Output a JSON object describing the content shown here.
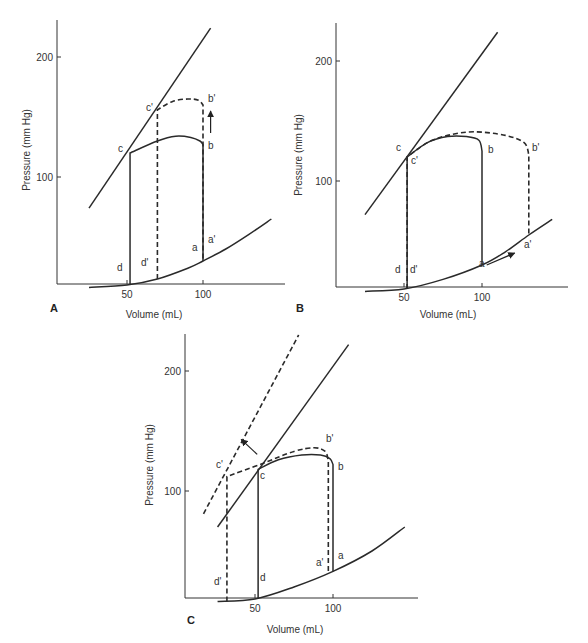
{
  "figure": {
    "panels": [
      {
        "id": "A",
        "label": "A",
        "frame": {
          "x_axis_px": 57,
          "y_axis_bottom_px": 284,
          "y_axis_top_px": 20,
          "x_axis_right_px": 285,
          "x50_px": 127,
          "x100_px": 203,
          "y100_px": 177,
          "y200_px": 57
        },
        "label_pos": {
          "x": 50,
          "y": 312
        },
        "xlabel_pos": {
          "x": 154,
          "y": 318
        },
        "ylabel_pos": {
          "x": 30,
          "y": 150
        }
      },
      {
        "id": "B",
        "label": "B",
        "frame": {
          "x_axis_px": 336,
          "y_axis_bottom_px": 287,
          "y_axis_top_px": 23,
          "x_axis_right_px": 568,
          "x50_px": 404,
          "x100_px": 482,
          "y100_px": 181,
          "y200_px": 61
        },
        "label_pos": {
          "x": 296,
          "y": 312
        },
        "xlabel_pos": {
          "x": 448,
          "y": 318
        },
        "ylabel_pos": {
          "x": 302,
          "y": 155
        }
      },
      {
        "id": "C",
        "label": "C",
        "frame": {
          "x_axis_px": 185,
          "y_axis_bottom_px": 598,
          "y_axis_top_px": 334,
          "x_axis_right_px": 418,
          "x50_px": 255,
          "x100_px": 333,
          "y100_px": 491,
          "y200_px": 371
        },
        "label_pos": {
          "x": 187,
          "y": 624
        },
        "xlabel_pos": {
          "x": 295,
          "y": 633
        },
        "ylabel_pos": {
          "x": 153,
          "y": 465
        }
      }
    ],
    "xlabel": "Volume (mL)",
    "ylabel": "Pressure (mm Hg)",
    "x_ticks": [
      "50",
      "100"
    ],
    "y_ticks": [
      "100",
      "200"
    ]
  },
  "chart_data": [
    {
      "type": "line",
      "panel": "A",
      "title": "",
      "xlabel": "Volume (mL)",
      "ylabel": "Pressure (mm Hg)",
      "x_ticks": [
        50,
        100
      ],
      "y_ticks": [
        100,
        200
      ],
      "series": [
        {
          "name": "ESPVR",
          "style": "solid",
          "points": [
            [
              25,
              74
            ],
            [
              105,
              224
            ]
          ]
        },
        {
          "name": "EDPVR",
          "style": "solid",
          "points": [
            [
              25,
              8
            ],
            [
              50,
              10
            ],
            [
              70,
              15
            ],
            [
              90,
              24
            ],
            [
              100,
              30
            ],
            [
              115,
              40
            ],
            [
              130,
              52
            ],
            [
              145,
              65
            ]
          ]
        },
        {
          "name": "Loop control",
          "style": "solid",
          "points": [
            [
              52,
              10
            ],
            [
              52,
              120
            ],
            [
              70,
              130
            ],
            [
              82,
              134
            ],
            [
              92,
              133
            ],
            [
              98,
              130
            ],
            [
              100,
              127
            ],
            [
              100,
              30
            ]
          ]
        },
        {
          "name": "Loop increased afterload",
          "style": "dashed",
          "points": [
            [
              70,
              15
            ],
            [
              70,
              156
            ],
            [
              80,
              163
            ],
            [
              90,
              165
            ],
            [
              97,
              164
            ],
            [
              100,
              160
            ],
            [
              100,
              30
            ]
          ]
        }
      ],
      "annotations": [
        {
          "text": "c",
          "at": [
            52,
            120
          ]
        },
        {
          "text": "c'",
          "at": [
            70,
            156
          ]
        },
        {
          "text": "b",
          "at": [
            100,
            127
          ]
        },
        {
          "text": "b'",
          "at": [
            100,
            163
          ]
        },
        {
          "text": "a",
          "at": [
            100,
            30
          ]
        },
        {
          "text": "a'",
          "at": [
            100,
            30
          ]
        },
        {
          "text": "d",
          "at": [
            52,
            10
          ]
        },
        {
          "text": "d'",
          "at": [
            70,
            15
          ]
        },
        {
          "text": "arrow-up",
          "at": [
            105,
            145
          ]
        }
      ]
    },
    {
      "type": "line",
      "panel": "B",
      "title": "",
      "xlabel": "Volume (mL)",
      "ylabel": "Pressure (mm Hg)",
      "x_ticks": [
        50,
        100
      ],
      "y_ticks": [
        100,
        200
      ],
      "series": [
        {
          "name": "ESPVR",
          "style": "solid",
          "points": [
            [
              25,
              72
            ],
            [
              110,
              224
            ]
          ]
        },
        {
          "name": "EDPVR",
          "style": "solid",
          "points": [
            [
              25,
              8
            ],
            [
              50,
              10
            ],
            [
              75,
              18
            ],
            [
              100,
              30
            ],
            [
              115,
              41
            ],
            [
              130,
              55
            ],
            [
              145,
              68
            ]
          ]
        },
        {
          "name": "Loop control",
          "style": "solid",
          "points": [
            [
              52,
              10
            ],
            [
              52,
              120
            ],
            [
              65,
              132
            ],
            [
              78,
              137
            ],
            [
              90,
              137
            ],
            [
              98,
              134
            ],
            [
              100,
              125
            ],
            [
              100,
              30
            ]
          ]
        },
        {
          "name": "Loop increased preload",
          "style": "dashed",
          "points": [
            [
              52,
              10
            ],
            [
              52,
              120
            ],
            [
              65,
              132
            ],
            [
              78,
              138
            ],
            [
              95,
              141
            ],
            [
              115,
              138
            ],
            [
              127,
              132
            ],
            [
              130,
              122
            ],
            [
              130,
              55
            ]
          ]
        }
      ],
      "annotations": [
        {
          "text": "c",
          "at": [
            52,
            120
          ]
        },
        {
          "text": "c'",
          "at": [
            52,
            120
          ]
        },
        {
          "text": "b",
          "at": [
            100,
            125
          ]
        },
        {
          "text": "b'",
          "at": [
            130,
            122
          ]
        },
        {
          "text": "a",
          "at": [
            100,
            30
          ]
        },
        {
          "text": "a'",
          "at": [
            130,
            55
          ]
        },
        {
          "text": "d",
          "at": [
            52,
            10
          ]
        },
        {
          "text": "d'",
          "at": [
            52,
            10
          ]
        },
        {
          "text": "arrow-right-up",
          "at": [
            112,
            35
          ]
        }
      ]
    },
    {
      "type": "line",
      "panel": "C",
      "title": "",
      "xlabel": "Volume (mL)",
      "ylabel": "Pressure (mm Hg)",
      "x_ticks": [
        50,
        100
      ],
      "y_ticks": [
        100,
        200
      ],
      "series": [
        {
          "name": "ESPVR",
          "style": "solid",
          "points": [
            [
              26,
              70
            ],
            [
              110,
              222
            ]
          ]
        },
        {
          "name": "ESPVR increased contractility",
          "style": "dashed",
          "points": [
            [
              17,
              81
            ],
            [
              78,
              230
            ]
          ]
        },
        {
          "name": "EDPVR",
          "style": "solid",
          "points": [
            [
              26,
              8
            ],
            [
              50,
              10
            ],
            [
              75,
              20
            ],
            [
              100,
              33
            ],
            [
              125,
              50
            ],
            [
              146,
              70
            ]
          ]
        },
        {
          "name": "Loop control",
          "style": "solid",
          "points": [
            [
              52,
              10
            ],
            [
              52,
              118
            ],
            [
              65,
              126
            ],
            [
              80,
              130
            ],
            [
              92,
              130
            ],
            [
              98,
              127
            ],
            [
              100,
              122
            ],
            [
              100,
              33
            ]
          ]
        },
        {
          "name": "Loop increased contractility",
          "style": "dashed",
          "points": [
            [
              32,
              8
            ],
            [
              32,
              112
            ],
            [
              55,
              123
            ],
            [
              75,
              133
            ],
            [
              88,
              136
            ],
            [
              95,
              133
            ],
            [
              97,
              125
            ],
            [
              97,
              32
            ]
          ]
        }
      ],
      "annotations": [
        {
          "text": "c",
          "at": [
            52,
            118
          ]
        },
        {
          "text": "c'",
          "at": [
            32,
            112
          ]
        },
        {
          "text": "b",
          "at": [
            100,
            122
          ]
        },
        {
          "text": "b'",
          "at": [
            97,
            133
          ]
        },
        {
          "text": "a",
          "at": [
            100,
            33
          ]
        },
        {
          "text": "a'",
          "at": [
            97,
            32
          ]
        },
        {
          "text": "d",
          "at": [
            52,
            10
          ]
        },
        {
          "text": "d'",
          "at": [
            32,
            8
          ]
        },
        {
          "text": "arrow-up-left",
          "at": [
            45,
            138
          ]
        }
      ]
    }
  ],
  "point_labels": {
    "A": [
      {
        "text": "c",
        "x": 118,
        "y": 152
      },
      {
        "text": "c'",
        "x": 146,
        "y": 111
      },
      {
        "text": "b",
        "x": 208,
        "y": 149
      },
      {
        "text": "b'",
        "x": 208,
        "y": 102
      },
      {
        "text": "a",
        "x": 192,
        "y": 251
      },
      {
        "text": "a'",
        "x": 208,
        "y": 243
      },
      {
        "text": "d",
        "x": 117,
        "y": 271
      },
      {
        "text": "d'",
        "x": 141,
        "y": 266
      }
    ],
    "B": [
      {
        "text": "c",
        "x": 396,
        "y": 151
      },
      {
        "text": "c'",
        "x": 411,
        "y": 164
      },
      {
        "text": "b",
        "x": 488,
        "y": 153
      },
      {
        "text": "b'",
        "x": 532,
        "y": 151
      },
      {
        "text": "a",
        "x": 479,
        "y": 267
      },
      {
        "text": "a'",
        "x": 524,
        "y": 248
      },
      {
        "text": "d",
        "x": 395,
        "y": 273
      },
      {
        "text": "d'",
        "x": 410,
        "y": 273
      }
    ],
    "C": [
      {
        "text": "c",
        "x": 260,
        "y": 479
      },
      {
        "text": "c'",
        "x": 216,
        "y": 468
      },
      {
        "text": "b",
        "x": 338,
        "y": 470
      },
      {
        "text": "b'",
        "x": 326,
        "y": 442
      },
      {
        "text": "a",
        "x": 338,
        "y": 559
      },
      {
        "text": "a'",
        "x": 316,
        "y": 566
      },
      {
        "text": "d",
        "x": 260,
        "y": 581
      },
      {
        "text": "d'",
        "x": 214,
        "y": 585
      }
    ]
  }
}
